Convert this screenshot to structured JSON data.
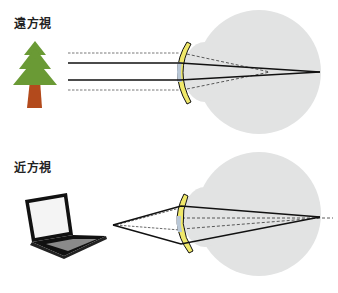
{
  "panels": [
    {
      "id": "far",
      "label": "遠方視",
      "object": "tree",
      "description": "Parallel rays from distant object pass through lens and converge on retina"
    },
    {
      "id": "near",
      "label": "近方視",
      "object": "laptop",
      "description": "Diverging rays from near object pass through lens and converge on retina"
    }
  ],
  "colors": {
    "eyeball": "#e2e3e3",
    "lens_yellow": "#f0e86a",
    "lens_blue": "#b9c7d6",
    "ray": "#111111",
    "tree_foliage": "#6a9a35",
    "tree_trunk": "#b34a1c",
    "laptop_body": "#111111",
    "laptop_screen": "#f4f4f4",
    "laptop_keys": "#8a8a8a"
  }
}
